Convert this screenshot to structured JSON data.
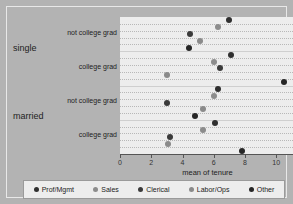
{
  "chart_data": {
    "type": "scatter",
    "title": "",
    "xlabel": "mean of tenure",
    "ylabel": "",
    "xlim": [
      0,
      11.2
    ],
    "xticks": [
      0,
      2,
      4,
      6,
      8,
      10
    ],
    "xticklabels": [
      "0",
      "2",
      "4",
      "6",
      "8",
      "10"
    ],
    "grid": true,
    "legend_position": "bottom",
    "legend": [
      "Prof/Mgmt",
      "Sales",
      "Clerical",
      "Labor/Ops",
      "Other"
    ],
    "series_colors": [
      "#2f2f2f",
      "#8c8c8c",
      "#3a3a3a",
      "#8a8a8a",
      "#262626"
    ],
    "group_labels": [
      "single",
      "married"
    ],
    "category_labels": [
      "not college grad",
      "college grad",
      "not college grad",
      "college grad"
    ],
    "groups": [
      {
        "group": "single",
        "category": "not college grad",
        "points": [
          {
            "series": "Prof/Mgmt",
            "value": 7.0
          },
          {
            "series": "Sales",
            "value": 6.3
          },
          {
            "series": "Clerical",
            "value": 4.5
          },
          {
            "series": "Labor/Ops",
            "value": 5.1
          },
          {
            "series": "Other",
            "value": 4.4
          }
        ]
      },
      {
        "group": "single",
        "category": "college grad",
        "points": [
          {
            "series": "Prof/Mgmt",
            "value": 7.1
          },
          {
            "series": "Sales",
            "value": 6.0
          },
          {
            "series": "Clerical",
            "value": 6.4
          },
          {
            "series": "Labor/Ops",
            "value": 3.0
          },
          {
            "series": "Other",
            "value": 10.5
          }
        ]
      },
      {
        "group": "married",
        "category": "not college grad",
        "points": [
          {
            "series": "Prof/Mgmt",
            "value": 6.3
          },
          {
            "series": "Sales",
            "value": 6.0
          },
          {
            "series": "Clerical",
            "value": 3.0
          },
          {
            "series": "Labor/Ops",
            "value": 5.3
          },
          {
            "series": "Other",
            "value": 4.8
          }
        ]
      },
      {
        "group": "married",
        "category": "college grad",
        "points": [
          {
            "series": "Prof/Mgmt",
            "value": 6.1
          },
          {
            "series": "Sales",
            "value": 5.3
          },
          {
            "series": "Clerical",
            "value": 3.2
          },
          {
            "series": "Labor/Ops",
            "value": 3.1
          },
          {
            "series": "Other",
            "value": 7.8
          }
        ]
      }
    ]
  }
}
